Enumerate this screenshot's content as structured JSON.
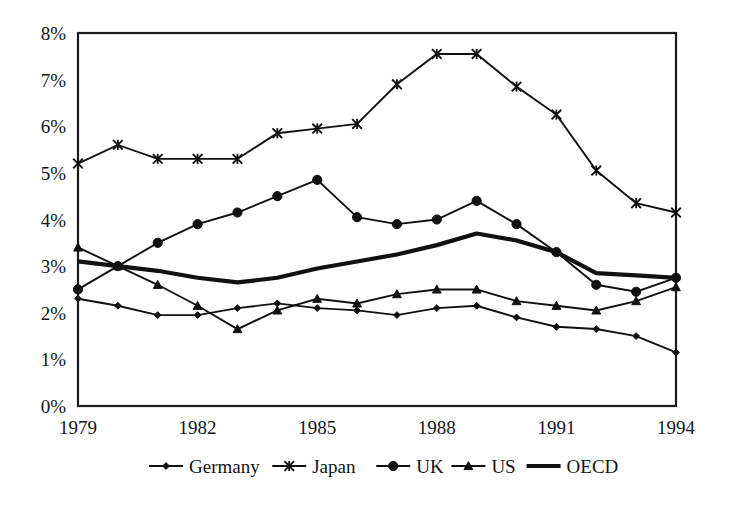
{
  "chart_data": {
    "type": "line",
    "title": "",
    "subtitle": "",
    "xlabel": "",
    "ylabel": "",
    "x": [
      1979,
      1980,
      1981,
      1982,
      1983,
      1984,
      1985,
      1986,
      1987,
      1988,
      1989,
      1990,
      1991,
      1992,
      1993,
      1994
    ],
    "xtick_labels": [
      "1979",
      "1982",
      "1985",
      "1988",
      "1991",
      "1994"
    ],
    "xtick_values": [
      1979,
      1982,
      1985,
      1988,
      1991,
      1994
    ],
    "ytick_labels": [
      "0%",
      "1%",
      "2%",
      "3%",
      "4%",
      "5%",
      "6%",
      "7%",
      "8%"
    ],
    "ytick_values": [
      0,
      1,
      2,
      3,
      4,
      5,
      6,
      7,
      8
    ],
    "xlim": [
      1979,
      1994
    ],
    "ylim": [
      0,
      8
    ],
    "y_unit": "%",
    "grid": false,
    "legend_position": "bottom",
    "series": [
      {
        "name": "Germany",
        "marker": "diamond",
        "line_width": "thin",
        "values": [
          2.3,
          2.15,
          1.95,
          1.95,
          2.1,
          2.2,
          2.1,
          2.05,
          1.95,
          2.1,
          2.15,
          1.9,
          1.7,
          1.65,
          1.5,
          1.15
        ]
      },
      {
        "name": "Japan",
        "marker": "x",
        "line_width": "thin",
        "values": [
          5.2,
          5.6,
          5.3,
          5.3,
          5.3,
          5.85,
          5.95,
          6.05,
          6.9,
          7.55,
          7.55,
          6.85,
          6.25,
          5.05,
          4.35,
          4.15
        ]
      },
      {
        "name": "UK",
        "marker": "circle",
        "line_width": "thin",
        "values": [
          2.5,
          3.0,
          3.5,
          3.9,
          4.15,
          4.5,
          4.85,
          4.05,
          3.9,
          4.0,
          4.4,
          3.9,
          3.3,
          2.6,
          2.45,
          2.75
        ]
      },
      {
        "name": "US",
        "marker": "triangle",
        "line_width": "thin",
        "values": [
          3.4,
          3.0,
          2.6,
          2.15,
          1.65,
          2.05,
          2.3,
          2.2,
          2.4,
          2.5,
          2.5,
          2.25,
          2.15,
          2.05,
          2.25,
          2.55
        ]
      },
      {
        "name": "OECD",
        "marker": "none",
        "line_width": "thick",
        "values": [
          3.1,
          3.0,
          2.9,
          2.75,
          2.65,
          2.75,
          2.95,
          3.1,
          3.25,
          3.45,
          3.7,
          3.55,
          3.3,
          2.85,
          2.8,
          2.75
        ]
      }
    ]
  },
  "legend": {
    "items": [
      {
        "label": "Germany",
        "marker": "diamond"
      },
      {
        "label": "Japan",
        "marker": "x"
      },
      {
        "label": "UK",
        "marker": "circle"
      },
      {
        "label": "US",
        "marker": "triangle"
      },
      {
        "label": "OECD",
        "marker": "none"
      }
    ]
  },
  "colors": {
    "line": "#111111",
    "axis": "#1c1c1c",
    "background": "#ffffff",
    "text": "#141414"
  }
}
